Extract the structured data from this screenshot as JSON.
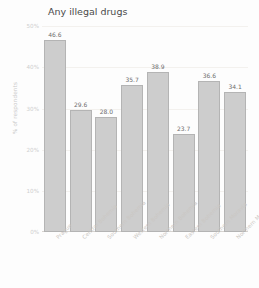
{
  "chart_data": {
    "type": "bar",
    "title": "Any illegal drugs",
    "xlabel": "",
    "ylabel": "% of respondents",
    "categories": [
      "Prague",
      "Central Bohemia",
      "Southern Bohemia",
      "Western Bohemia",
      "Northern Bohemia",
      "Eastern Bohemia",
      "Southern Moravia",
      "Northern Moravia"
    ],
    "values": [
      46.6,
      29.6,
      28.0,
      35.7,
      38.9,
      23.7,
      36.6,
      34.1
    ],
    "value_labels": [
      "46.6",
      "29.6",
      "28.0",
      "35.7",
      "38.9",
      "23.7",
      "36.6",
      "34.1"
    ],
    "ylim": [
      0,
      52
    ],
    "yticks": [
      0,
      10,
      20,
      30,
      40,
      50
    ],
    "ytick_labels": [
      "0%",
      "10%",
      "20%",
      "30%",
      "40%",
      "50%"
    ],
    "grid": true,
    "legend": null,
    "bar_color": "#cdcdcd",
    "bar_edge_color": "#b4b4b4",
    "background": "#fdfdfd",
    "text_color": "#6d6d6d",
    "axis_text_color": "#cbc7c3"
  }
}
